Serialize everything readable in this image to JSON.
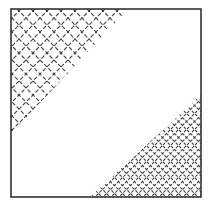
{
  "figure": {
    "colors": {
      "background": "#ffffff",
      "frame": "#333333",
      "hatch": "#444444"
    },
    "frame": {
      "x": 11,
      "y": 9,
      "width": 190,
      "height": 188
    },
    "regions": [
      {
        "name": "top-left-hatched-triangle",
        "points": [
          [
            11,
            9
          ],
          [
            128,
            9
          ],
          [
            11,
            134
          ]
        ],
        "hatch_spacing": 14,
        "hatch_style": "dashed cross-hatch, sparse"
      },
      {
        "name": "bottom-right-hatched-triangle",
        "points": [
          [
            201,
            95
          ],
          [
            201,
            197
          ],
          [
            90,
            197
          ]
        ],
        "hatch_spacing": 8,
        "hatch_style": "dashed cross-hatch, dense"
      }
    ]
  }
}
